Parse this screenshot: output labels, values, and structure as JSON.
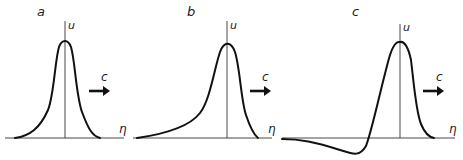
{
  "figure": {
    "panels": [
      {
        "id": "a",
        "label": "a",
        "y_axis_label": "u",
        "x_axis_label": "η",
        "velocity_label": "c",
        "description": "symmetric hump (soliton)"
      },
      {
        "id": "b",
        "label": "b",
        "y_axis_label": "u",
        "x_axis_label": "η",
        "velocity_label": "c",
        "description": "asymmetric hump with long trailing tail"
      },
      {
        "id": "c",
        "label": "c",
        "y_axis_label": "u",
        "x_axis_label": "η",
        "velocity_label": "c",
        "description": "hump preceded by negative trough"
      }
    ],
    "colors": {
      "line": "#111111",
      "background": "#ffffff"
    }
  }
}
